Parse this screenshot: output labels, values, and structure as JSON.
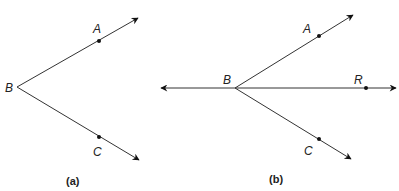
{
  "figures": [
    {
      "id": "a",
      "caption": "(a)",
      "vertex": {
        "label": "B",
        "x": 17,
        "y": 87
      },
      "rays": [
        {
          "name": "BA",
          "point": {
            "label": "A",
            "x": 99,
            "y": 41
          },
          "tip": {
            "x": 138,
            "y": 18
          }
        },
        {
          "name": "BC",
          "point": {
            "label": "C",
            "x": 99,
            "y": 137
          },
          "tip": {
            "x": 139,
            "y": 160
          }
        }
      ]
    },
    {
      "id": "b",
      "caption": "(b)",
      "vertex": {
        "label": "B",
        "x": 235,
        "y": 88
      },
      "rays": [
        {
          "name": "BA",
          "point": {
            "label": "A",
            "x": 319,
            "y": 36
          },
          "tip": {
            "x": 353,
            "y": 15
          }
        },
        {
          "name": "BR",
          "point": {
            "label": "R",
            "x": 366,
            "y": 88
          },
          "tip": {
            "x": 396,
            "y": 88
          }
        },
        {
          "name": "BC",
          "point": {
            "label": "C",
            "x": 319,
            "y": 139
          },
          "tip": {
            "x": 351,
            "y": 159
          }
        },
        {
          "name": "B-left",
          "point": null,
          "tip": {
            "x": 161,
            "y": 88
          }
        }
      ]
    }
  ],
  "labels": {
    "a_A": "A",
    "a_B": "B",
    "a_C": "C",
    "b_A": "A",
    "b_B": "B",
    "b_R": "R",
    "b_C": "C",
    "cap_a": "(a)",
    "cap_b": "(b)"
  },
  "colors": {
    "line": "#333333",
    "ink": "#111111",
    "background": "#ffffff"
  }
}
